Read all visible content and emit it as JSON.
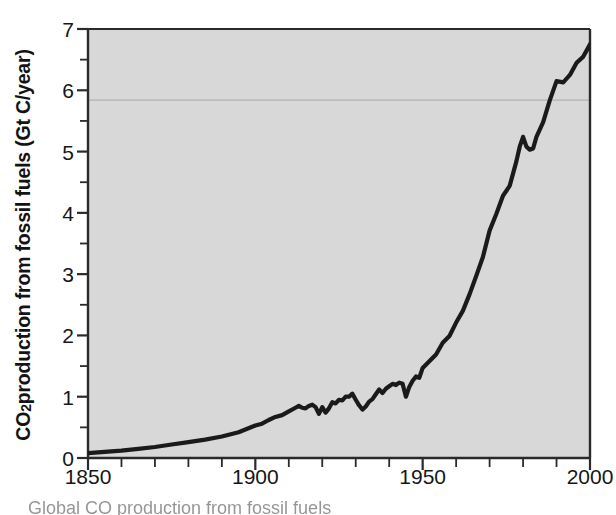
{
  "chart_data": {
    "type": "line",
    "title": "",
    "xlabel": "",
    "ylabel": "CO2 production from fossil fuels (Gt C/year)",
    "ylabel_parts": {
      "prefix": "CO",
      "subscript": "2",
      "suffix": " production from fossil fuels (Gt C/year)"
    },
    "xlim": [
      1850,
      2000
    ],
    "ylim": [
      0,
      7
    ],
    "x_ticks_major": [
      1850,
      1900,
      1950,
      2000
    ],
    "x_tick_labels": [
      "1850",
      "1900",
      "1950",
      "2000"
    ],
    "x_ticks_minor": [
      1860,
      1870,
      1880,
      1890,
      1910,
      1920,
      1930,
      1940,
      1960,
      1970,
      1980,
      1990
    ],
    "y_ticks_major": [
      0,
      1,
      2,
      3,
      4,
      5,
      6,
      7
    ],
    "y_tick_labels": [
      "0",
      "1",
      "2",
      "3",
      "4",
      "5",
      "6",
      "7"
    ],
    "y_ticks_minor": [
      0.5,
      1.5,
      2.5,
      3.5,
      4.5,
      5.5,
      6.5
    ],
    "grid": false,
    "legend": null,
    "plot_background_color": "#d8d8d8",
    "line_color": "#1a1a1a",
    "line_width_px": 4.2,
    "artifact_line": {
      "description": "faint horizontal scan/fold line",
      "y_value": 5.84,
      "color": "#a8a8a8"
    },
    "series": [
      {
        "name": "CO2 production from fossil fuels",
        "units": "Gt C/year",
        "x": [
          1850,
          1855,
          1860,
          1865,
          1870,
          1875,
          1880,
          1885,
          1890,
          1895,
          1900,
          1902,
          1904,
          1906,
          1908,
          1910,
          1912,
          1913,
          1914,
          1915,
          1916,
          1917,
          1918,
          1919,
          1920,
          1921,
          1922,
          1923,
          1924,
          1925,
          1926,
          1927,
          1928,
          1929,
          1930,
          1931,
          1932,
          1933,
          1934,
          1935,
          1936,
          1937,
          1938,
          1939,
          1940,
          1941,
          1942,
          1943,
          1944,
          1945,
          1946,
          1947,
          1948,
          1949,
          1950,
          1952,
          1954,
          1956,
          1958,
          1960,
          1962,
          1964,
          1966,
          1968,
          1970,
          1972,
          1974,
          1976,
          1978,
          1979,
          1980,
          1981,
          1982,
          1983,
          1984,
          1986,
          1988,
          1990,
          1992,
          1994,
          1996,
          1998,
          2000
        ],
        "y": [
          0.08,
          0.1,
          0.12,
          0.15,
          0.18,
          0.22,
          0.26,
          0.3,
          0.35,
          0.42,
          0.53,
          0.56,
          0.62,
          0.67,
          0.7,
          0.76,
          0.82,
          0.85,
          0.82,
          0.81,
          0.85,
          0.87,
          0.83,
          0.72,
          0.83,
          0.74,
          0.81,
          0.91,
          0.89,
          0.95,
          0.94,
          1.0,
          1.0,
          1.05,
          0.95,
          0.86,
          0.79,
          0.84,
          0.92,
          0.96,
          1.04,
          1.12,
          1.06,
          1.13,
          1.17,
          1.21,
          1.19,
          1.23,
          1.21,
          1.0,
          1.16,
          1.26,
          1.33,
          1.31,
          1.47,
          1.58,
          1.69,
          1.88,
          1.99,
          2.21,
          2.4,
          2.67,
          2.97,
          3.28,
          3.71,
          3.98,
          4.28,
          4.44,
          4.84,
          5.08,
          5.24,
          5.08,
          5.03,
          5.05,
          5.24,
          5.48,
          5.84,
          6.15,
          6.13,
          6.25,
          6.45,
          6.55,
          6.75
        ]
      }
    ],
    "annotations": []
  },
  "axes": {
    "plot_left_px": 88,
    "plot_right_px": 590,
    "plot_top_px": 29,
    "plot_bottom_px": 458
  },
  "caption": {
    "partial_text": "Global CO  production from fossil fuels"
  }
}
